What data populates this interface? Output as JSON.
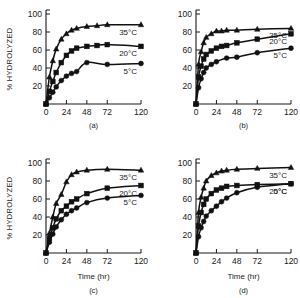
{
  "figure": {
    "ylabel": "% HYDROLYZED",
    "xlabel": "Time (hr)",
    "series_labels": {
      "hot": "35°C",
      "warm": "20°C",
      "cold": "5°C"
    },
    "captions": {
      "a": "(a)",
      "b": "(b)",
      "c": "(c)",
      "d": "(d)"
    },
    "colors": {
      "ink": "#111111",
      "background": "#ffffff"
    }
  },
  "axes": {
    "x_ticks": [
      "0",
      "24",
      "48",
      "72",
      "120"
    ],
    "y_ticks": [
      "20",
      "40",
      "60",
      "80",
      "100"
    ]
  },
  "chart_data": [
    {
      "type": "scatter",
      "panel": "(a)",
      "title": "",
      "xlabel": "Time (hr)",
      "ylabel": "% HYDROLYZED",
      "xlim": [
        0,
        120
      ],
      "ylim": [
        0,
        100
      ],
      "x_ticks": [
        0,
        24,
        48,
        72,
        120
      ],
      "y_ticks": [
        20,
        40,
        60,
        80,
        100
      ],
      "grid": false,
      "legend": "inline-right",
      "series": [
        {
          "name": "35°C",
          "marker": "triangle",
          "x": [
            0,
            4,
            8,
            12,
            18,
            24,
            30,
            36,
            48,
            60,
            72,
            120
          ],
          "values": [
            0,
            30,
            48,
            61,
            72,
            78,
            82,
            84,
            86,
            87,
            88,
            88
          ]
        },
        {
          "name": "20°C",
          "marker": "square",
          "x": [
            0,
            4,
            8,
            12,
            18,
            24,
            30,
            36,
            48,
            60,
            72,
            120
          ],
          "values": [
            0,
            14,
            25,
            35,
            46,
            54,
            59,
            62,
            64,
            65,
            66,
            64
          ]
        },
        {
          "name": "5°C",
          "marker": "circle",
          "x": [
            0,
            4,
            8,
            12,
            18,
            24,
            30,
            36,
            48,
            72,
            120
          ],
          "values": [
            0,
            7,
            13,
            19,
            26,
            31,
            34,
            36,
            46,
            44,
            45
          ]
        }
      ]
    },
    {
      "type": "scatter",
      "panel": "(b)",
      "title": "",
      "xlabel": "Time (hr)",
      "ylabel": "% HYDROLYZED",
      "xlim": [
        0,
        120
      ],
      "ylim": [
        0,
        100
      ],
      "x_ticks": [
        0,
        24,
        48,
        72,
        120
      ],
      "y_ticks": [
        20,
        40,
        60,
        80,
        100
      ],
      "grid": false,
      "legend": "inline-right",
      "series": [
        {
          "name": "35°C",
          "marker": "triangle",
          "x": [
            0,
            3,
            6,
            9,
            12,
            18,
            24,
            30,
            36,
            48,
            72,
            120
          ],
          "values": [
            0,
            44,
            58,
            68,
            74,
            78,
            81,
            81,
            82,
            82,
            83,
            84
          ]
        },
        {
          "name": "20°C",
          "marker": "square",
          "x": [
            0,
            3,
            6,
            9,
            12,
            18,
            24,
            30,
            36,
            48,
            72,
            120
          ],
          "values": [
            0,
            30,
            42,
            50,
            55,
            59,
            62,
            64,
            65,
            68,
            72,
            78
          ]
        },
        {
          "name": "5°C",
          "marker": "circle",
          "x": [
            0,
            3,
            6,
            9,
            12,
            18,
            24,
            36,
            48,
            72,
            120
          ],
          "values": [
            0,
            18,
            28,
            35,
            40,
            44,
            47,
            51,
            52,
            57,
            62
          ]
        }
      ]
    },
    {
      "type": "scatter",
      "panel": "(c)",
      "title": "",
      "xlabel": "Time (hr)",
      "ylabel": "% HYDROLYZED",
      "xlim": [
        0,
        120
      ],
      "ylim": [
        0,
        100
      ],
      "x_ticks": [
        0,
        24,
        48,
        72,
        120
      ],
      "y_ticks": [
        20,
        40,
        60,
        80,
        100
      ],
      "grid": false,
      "legend": "inline-right",
      "series": [
        {
          "name": "35°C",
          "marker": "triangle",
          "x": [
            0,
            4,
            8,
            12,
            18,
            24,
            30,
            36,
            48,
            72,
            120
          ],
          "values": [
            0,
            22,
            40,
            55,
            65,
            79,
            87,
            90,
            92,
            93,
            92
          ]
        },
        {
          "name": "20°C",
          "marker": "square",
          "x": [
            0,
            4,
            8,
            12,
            18,
            24,
            30,
            36,
            48,
            72,
            120
          ],
          "values": [
            0,
            16,
            28,
            38,
            47,
            52,
            57,
            60,
            66,
            72,
            75
          ]
        },
        {
          "name": "5°C",
          "marker": "circle",
          "x": [
            0,
            4,
            8,
            12,
            18,
            24,
            30,
            36,
            48,
            72,
            120
          ],
          "values": [
            0,
            12,
            21,
            29,
            37,
            43,
            47,
            50,
            56,
            61,
            64
          ]
        }
      ]
    },
    {
      "type": "scatter",
      "panel": "(d)",
      "title": "",
      "xlabel": "Time (hr)",
      "ylabel": "% HYDROLYZED",
      "xlim": [
        0,
        120
      ],
      "ylim": [
        0,
        100
      ],
      "x_ticks": [
        0,
        24,
        48,
        72,
        120
      ],
      "y_ticks": [
        20,
        40,
        60,
        80,
        100
      ],
      "grid": false,
      "legend": "inline-right",
      "series": [
        {
          "name": "35°C",
          "marker": "triangle",
          "x": [
            0,
            3,
            6,
            9,
            12,
            18,
            24,
            30,
            36,
            48,
            72,
            120
          ],
          "values": [
            0,
            45,
            62,
            72,
            80,
            86,
            89,
            91,
            92,
            93,
            94,
            95
          ]
        },
        {
          "name": "20°C",
          "marker": "square",
          "x": [
            0,
            3,
            6,
            9,
            12,
            18,
            24,
            30,
            36,
            48,
            72,
            120
          ],
          "values": [
            0,
            30,
            45,
            54,
            60,
            66,
            70,
            72,
            74,
            75,
            76,
            77
          ]
        },
        {
          "name": "5°C",
          "marker": "circle",
          "x": [
            0,
            3,
            6,
            9,
            12,
            18,
            24,
            30,
            36,
            48,
            72,
            120
          ],
          "values": [
            0,
            18,
            28,
            35,
            41,
            47,
            52,
            57,
            61,
            67,
            73,
            77
          ]
        }
      ]
    }
  ]
}
